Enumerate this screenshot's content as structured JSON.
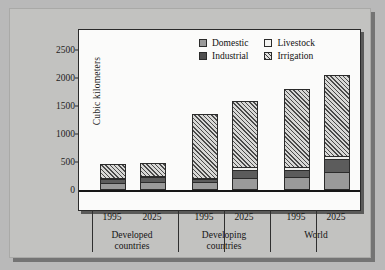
{
  "chart_data": {
    "type": "bar",
    "subtype": "stacked-bar-grouped",
    "title": "",
    "xlabel": "",
    "ylabel": "Cubic kilometers",
    "ylim": [
      0,
      2750
    ],
    "yticks": [
      0,
      500,
      1000,
      1500,
      2000,
      2500
    ],
    "ytick_labels": [
      "0",
      "500",
      "1000",
      "1500",
      "2000",
      "2500"
    ],
    "grid": false,
    "legend_position": "top-right-inside",
    "categories": [
      "1995",
      "2025",
      "1995",
      "2025",
      "1995",
      "2025"
    ],
    "groups": [
      {
        "name": "Developed countries",
        "years": [
          "1995",
          "2025"
        ]
      },
      {
        "name": "Developing countries",
        "years": [
          "1995",
          "2025"
        ]
      },
      {
        "name": "World",
        "years": [
          "1995",
          "2025"
        ]
      }
    ],
    "series": [
      {
        "name": "Domestic",
        "color": "#9a9a9a",
        "pattern": "solid-medium-gray",
        "values": [
          90,
          110,
          110,
          180,
          200,
          290
        ]
      },
      {
        "name": "Industrial",
        "color": "#5c5c5c",
        "pattern": "solid-dark-gray",
        "values": [
          75,
          100,
          50,
          150,
          125,
          230
        ]
      },
      {
        "name": "Livestock",
        "color": "#ededeb",
        "pattern": "solid-light",
        "values": [
          25,
          30,
          30,
          50,
          55,
          70
        ]
      },
      {
        "name": "Irrigation",
        "color": "#d8d8d6",
        "pattern": "diagonal-hatch",
        "values": [
          280,
          250,
          1170,
          1210,
          1420,
          1470
        ]
      }
    ],
    "totals": [
      470,
      490,
      1360,
      1590,
      1800,
      2060
    ],
    "units": "cubic kilometers"
  },
  "legend": {
    "items": [
      {
        "label": "Domestic",
        "swatch": "swatch-domestic-icon"
      },
      {
        "label": "Livestock",
        "swatch": "swatch-livestock-icon"
      },
      {
        "label": "Industrial",
        "swatch": "swatch-industrial-icon"
      },
      {
        "label": "Irrigation",
        "swatch": "swatch-irrigation-icon"
      }
    ]
  },
  "axis": {
    "y_title": "Cubic kilometers"
  }
}
